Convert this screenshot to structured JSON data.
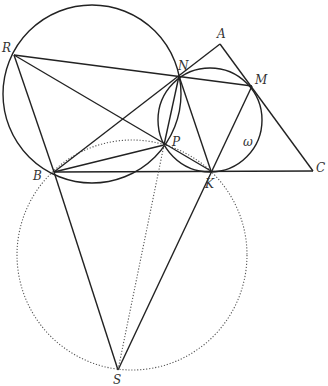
{
  "points": {
    "A": {
      "label": "A",
      "x": 220,
      "y": 44,
      "lx": 217,
      "ly": 38
    },
    "M": {
      "label": "M",
      "x": 252,
      "y": 86,
      "lx": 255,
      "ly": 84
    },
    "N": {
      "label": "N",
      "x": 179,
      "y": 76,
      "lx": 178,
      "ly": 70
    },
    "R": {
      "label": "R",
      "x": 14,
      "y": 55,
      "lx": 2,
      "ly": 52
    },
    "P": {
      "label": "P",
      "x": 164,
      "y": 145,
      "lx": 172,
      "ly": 146
    },
    "B": {
      "label": "B",
      "x": 54,
      "y": 172,
      "lx": 33,
      "ly": 180
    },
    "K": {
      "label": "K",
      "x": 211,
      "y": 171,
      "lx": 205,
      "ly": 188
    },
    "C": {
      "label": "C",
      "x": 313,
      "y": 171,
      "lx": 316,
      "ly": 172
    },
    "S": {
      "label": "S",
      "x": 118,
      "y": 370,
      "lx": 113,
      "ly": 384
    }
  },
  "circle_label": {
    "text": "ω",
    "x": 243,
    "y": 146
  },
  "circles": [
    {
      "name": "big-circle",
      "cx": 92,
      "cy": 94,
      "r": 89,
      "style": "solid"
    },
    {
      "name": "omega-circle",
      "cx": 210,
      "cy": 120,
      "r": 52,
      "style": "solid"
    },
    {
      "name": "dotted-circle",
      "cx": 132,
      "cy": 255,
      "r": 115,
      "style": "dotted"
    }
  ],
  "segments": [
    [
      "R",
      "M",
      "solid"
    ],
    [
      "R",
      "B",
      "solid"
    ],
    [
      "R",
      "K",
      "solid"
    ],
    [
      "B",
      "A",
      "solid"
    ],
    [
      "A",
      "C",
      "solid"
    ],
    [
      "B",
      "C",
      "solid"
    ],
    [
      "B",
      "P",
      "solid"
    ],
    [
      "N",
      "P",
      "solid"
    ],
    [
      "N",
      "K",
      "solid"
    ],
    [
      "M",
      "S",
      "solid"
    ],
    [
      "B",
      "S",
      "solid"
    ],
    [
      "P",
      "S",
      "dotted"
    ]
  ]
}
